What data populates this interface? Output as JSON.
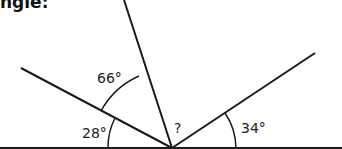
{
  "title": "ngle:",
  "diagram": {
    "labels": {
      "angle_a": "66°",
      "angle_b": "28°",
      "angle_unknown": "?",
      "angle_c": "34°"
    },
    "colors": {
      "line": "#1a1a1a",
      "text": "#222222"
    }
  }
}
